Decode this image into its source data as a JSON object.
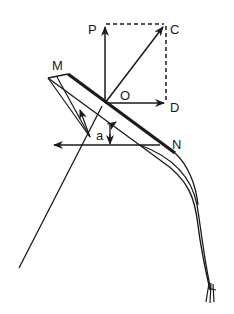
{
  "diagram": {
    "labels": {
      "P": "P",
      "C": "C",
      "O": "O",
      "D": "D",
      "M": "M",
      "N": "N",
      "a": "a"
    },
    "colors": {
      "ink": "#1a1a1a",
      "background": "#ffffff"
    }
  }
}
